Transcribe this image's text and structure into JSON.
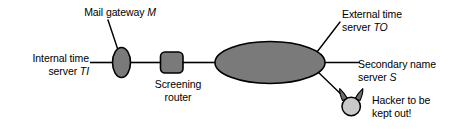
{
  "diagram": {
    "colors": {
      "node_fill_dark": "#7a7a7a",
      "node_fill_light": "#c9c9c9",
      "stroke": "#000000",
      "background": "#ffffff",
      "text": "#000000"
    },
    "nodes": [
      {
        "id": "mail-gateway",
        "shape": "ellipse-vertical",
        "label_line1": "Mail gateway ",
        "label_emphasis": "M",
        "label_line2": "",
        "fill": "#7a7a7a"
      },
      {
        "id": "internal-time-server",
        "shape": "line-terminal",
        "label_line1": "Internal time",
        "label_line2": "server ",
        "label_emphasis": "TI",
        "fill": "none"
      },
      {
        "id": "screening-router",
        "shape": "rounded-square",
        "label_line1": "Screening",
        "label_line2": "router",
        "label_emphasis": "",
        "fill": "#7a7a7a"
      },
      {
        "id": "internet-cloud",
        "shape": "ellipse-horizontal",
        "label_line1": "",
        "label_line2": "",
        "label_emphasis": "",
        "fill": "#7a7a7a"
      },
      {
        "id": "external-time-server",
        "shape": "leader-callout",
        "label_line1": "External time",
        "label_line2": "server ",
        "label_emphasis": "TO",
        "fill": "none"
      },
      {
        "id": "secondary-name-server",
        "shape": "line-terminal",
        "label_line1": "Secondary name",
        "label_line2": "server ",
        "label_emphasis": "S",
        "fill": "none"
      },
      {
        "id": "hacker",
        "shape": "circle-with-horns",
        "label_line1": "Hacker to be",
        "label_line2": "kept out!",
        "label_emphasis": "",
        "fill": "#c9c9c9"
      }
    ]
  }
}
